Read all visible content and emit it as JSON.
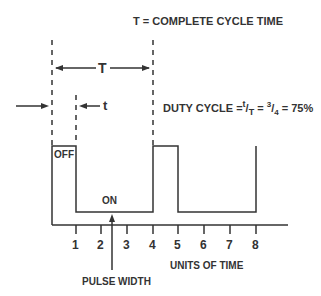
{
  "title": "T = COMPLETE CYCLE TIME",
  "period_label": "T",
  "pulse_label": "t",
  "duty_cycle": {
    "prefix": "DUTY CYCLE =",
    "num": "t",
    "den": "T",
    "eq1": " = ",
    "frac_num": "3",
    "frac_den": "4",
    "eq2": " = 75%"
  },
  "state_labels": {
    "off": "OFF",
    "on": "ON"
  },
  "ticks": [
    "1",
    "2",
    "3",
    "4",
    "5",
    "6",
    "7",
    "8"
  ],
  "x_axis_label": "UNITS OF TIME",
  "pointer_label": "PULSE WIDTH",
  "colors": {
    "line": "#333333",
    "text": "#333333"
  }
}
